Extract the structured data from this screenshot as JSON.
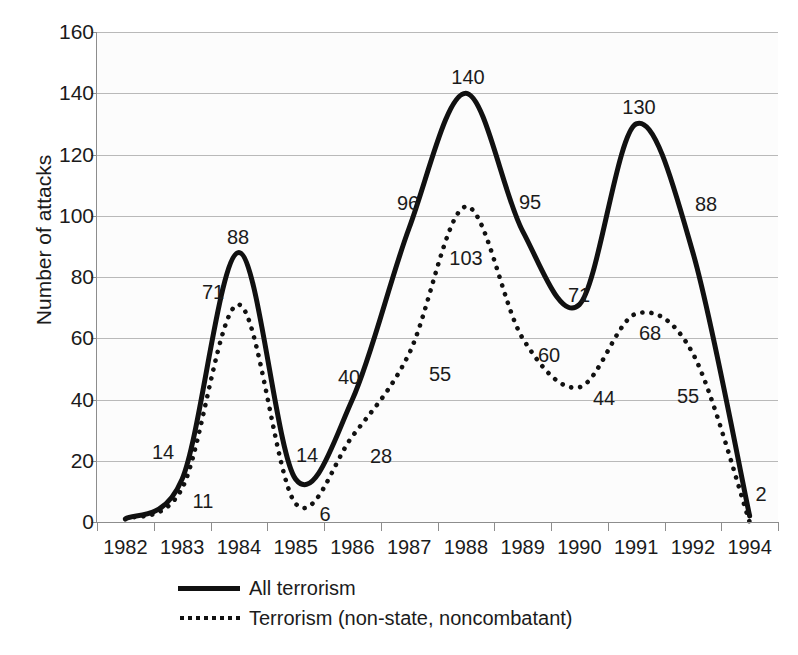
{
  "chart_data": {
    "type": "line",
    "title": "",
    "xlabel": "",
    "ylabel": "Number of attacks",
    "ylim": [
      0,
      160
    ],
    "yticks": [
      0,
      20,
      40,
      60,
      80,
      100,
      120,
      140,
      160
    ],
    "grid": true,
    "legend_position": "bottom",
    "categories": [
      "1982",
      "1983",
      "1984",
      "1985",
      "1986",
      "1987",
      "1988",
      "1989",
      "1990",
      "1991",
      "1992",
      "1994"
    ],
    "series": [
      {
        "name": "All terrorism",
        "style": "solid",
        "color": "#111111",
        "values": [
          1,
          14,
          88,
          14,
          40,
          96,
          140,
          95,
          71,
          130,
          88,
          2
        ],
        "labels": [
          "",
          "14",
          "88",
          "14",
          "40",
          "96",
          "140",
          "95",
          "71",
          "130",
          "88",
          "2"
        ]
      },
      {
        "name": "Terrorism (non-state, noncombatant)",
        "style": "dotted",
        "color": "#111111",
        "values": [
          1,
          11,
          71,
          6,
          28,
          55,
          103,
          60,
          44,
          68,
          55,
          0
        ],
        "labels": [
          "",
          "11",
          "71",
          "6",
          "28",
          "55",
          "103",
          "60",
          "44",
          "68",
          "55",
          ""
        ]
      }
    ]
  },
  "yaxis": {
    "title": "Number of attacks",
    "ticks": [
      "160",
      "140",
      "120",
      "100",
      "80",
      "60",
      "40",
      "20",
      "0"
    ]
  },
  "xaxis": {
    "ticks": [
      "1982",
      "1983",
      "1984",
      "1985",
      "1986",
      "1987",
      "1988",
      "1989",
      "1990",
      "1991",
      "1992",
      "1994"
    ]
  },
  "data_labels": [
    {
      "text": "14",
      "x": 163,
      "y": 452
    },
    {
      "text": "11",
      "x": 203,
      "y": 501
    },
    {
      "text": "88",
      "x": 238,
      "y": 237
    },
    {
      "text": "71",
      "x": 213,
      "y": 292
    },
    {
      "text": "14",
      "x": 307,
      "y": 455
    },
    {
      "text": "6",
      "x": 325,
      "y": 514
    },
    {
      "text": "40",
      "x": 349,
      "y": 377
    },
    {
      "text": "28",
      "x": 381,
      "y": 456
    },
    {
      "text": "96",
      "x": 408,
      "y": 203
    },
    {
      "text": "55",
      "x": 440,
      "y": 374
    },
    {
      "text": "140",
      "x": 468,
      "y": 77
    },
    {
      "text": "103",
      "x": 466,
      "y": 258
    },
    {
      "text": "95",
      "x": 530,
      "y": 202
    },
    {
      "text": "60",
      "x": 549,
      "y": 355
    },
    {
      "text": "71",
      "x": 579,
      "y": 295
    },
    {
      "text": "44",
      "x": 604,
      "y": 398
    },
    {
      "text": "130",
      "x": 639,
      "y": 107
    },
    {
      "text": "68",
      "x": 650,
      "y": 333
    },
    {
      "text": "88",
      "x": 706,
      "y": 204
    },
    {
      "text": "55",
      "x": 688,
      "y": 396
    },
    {
      "text": "2",
      "x": 761,
      "y": 494
    }
  ],
  "legend": {
    "items": [
      {
        "label": "All terrorism",
        "style": "solid",
        "key": "solid-line-key"
      },
      {
        "label": "Terrorism (non-state, noncombatant)",
        "style": "dotted",
        "key": "dotted-line-key"
      }
    ]
  }
}
